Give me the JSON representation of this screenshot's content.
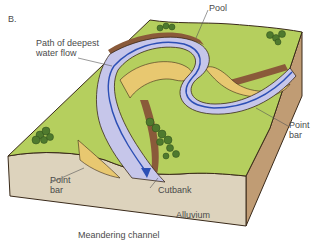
{
  "figure": {
    "panel_label": "B.",
    "caption": "Meandering channel"
  },
  "labels": {
    "path_of_deepest": "Path of deepest",
    "water_flow": "water flow",
    "pool": "Pool",
    "point_bar_right_1": "Point",
    "point_bar_right_2": "bar",
    "point_bar_left_1": "Point",
    "point_bar_left_2": "bar",
    "cutbank": "Cutbank",
    "alluvium": "Alluvium"
  },
  "colors": {
    "floodplain": "#b5cf5e",
    "floodplain_dark": "#8fb04a",
    "water": "#c6c6ea",
    "deep_flow_line": "#2c4fb5",
    "point_bar_sand": "#e8c870",
    "cutbank_brown": "#8a5a3a",
    "alluvium_front": "#ddd3bd",
    "alluvium_side": "#c09c74",
    "outline": "#3a2a1a",
    "trees": "#4f7a2e",
    "label_text": "#4a4a4a"
  }
}
